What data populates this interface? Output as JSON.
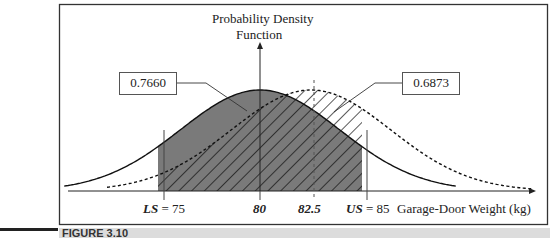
{
  "chart_data": {
    "type": "area",
    "title": "Probability Density Function",
    "ylabel": "Probability Density Function",
    "xlabel": "Garage-Door Weight (kg)",
    "grid": false,
    "legend": "none",
    "series": [
      {
        "name": "Process centered at 80",
        "mean": 80,
        "style": "solid",
        "fill": "gray",
        "area_within_spec": 0.766
      },
      {
        "name": "Process centered at 82.5",
        "mean": 82.5,
        "style": "dashed",
        "fill": "hatched",
        "area_within_spec": 0.6873
      }
    ],
    "spec_limits": {
      "LS": 75,
      "US": 85
    },
    "tick_labels": [
      "LS = 75",
      "80",
      "82.5",
      "US = 85"
    ],
    "annotations": [
      "0.7660",
      "0.6873"
    ]
  },
  "figure": {
    "y_axis_label_line1": "Probability Density",
    "y_axis_label_line2": "Function",
    "x_axis_label": "Garage-Door Weight (kg)",
    "ticks": {
      "ls_prefix": "LS",
      "ls_value": " = 75",
      "mean1": "80",
      "mean2": "82.5",
      "us_prefix": "US",
      "us_value": " = 85"
    },
    "callout_left": "0.7660",
    "callout_right": "0.6873"
  },
  "caption": {
    "text": "FIGURE 3.10"
  }
}
